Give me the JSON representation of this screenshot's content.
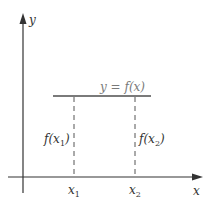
{
  "diagram": {
    "colors": {
      "axes": "#333333",
      "function_line": "#7a7a7a",
      "dashed_lines": "#555555",
      "function_label": "#7a7a7a",
      "text": "#333333"
    },
    "axes": {
      "x_label": "x",
      "y_label": "y"
    },
    "function": {
      "label": "y = f(x)",
      "type": "constant horizontal line"
    },
    "points": [
      {
        "x_label": "x",
        "x_sub": "1",
        "value_label": "f(x",
        "value_sub": "1",
        "value_close": ")"
      },
      {
        "x_label": "x",
        "x_sub": "2",
        "value_label": "f(x",
        "value_sub": "2",
        "value_close": ")"
      }
    ]
  }
}
